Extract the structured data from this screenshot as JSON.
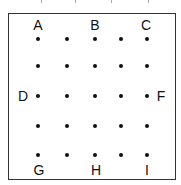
{
  "diagram": {
    "title": "",
    "grid": {
      "rows": 5,
      "cols": 5
    },
    "dot_x": [
      38,
      67,
      95,
      121,
      147
    ],
    "dot_y": [
      39,
      66,
      96,
      126,
      155
    ],
    "labels": [
      {
        "id": "A",
        "text": "A",
        "x": 38,
        "y": 25
      },
      {
        "id": "B",
        "text": "B",
        "x": 95,
        "y": 25
      },
      {
        "id": "C",
        "text": "C",
        "x": 146,
        "y": 25
      },
      {
        "id": "D",
        "text": "D",
        "x": 23,
        "y": 96
      },
      {
        "id": "F",
        "text": "F",
        "x": 161,
        "y": 96
      },
      {
        "id": "G",
        "text": "G",
        "x": 39,
        "y": 170
      },
      {
        "id": "H",
        "text": "H",
        "x": 96,
        "y": 170
      },
      {
        "id": "I",
        "text": "I",
        "x": 147,
        "y": 170
      }
    ],
    "colors": {
      "dot": "#111111",
      "border": "#333333",
      "text": "#111111"
    }
  }
}
